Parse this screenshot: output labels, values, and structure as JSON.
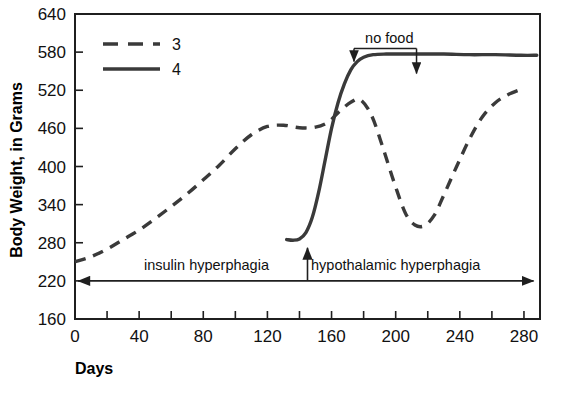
{
  "chart_data": {
    "type": "line",
    "title": "",
    "xlabel": "Days",
    "ylabel": "Body Weight, in Grams",
    "xlim": [
      0,
      290
    ],
    "ylim": [
      160,
      640
    ],
    "grid": false,
    "legend_position": "top-left",
    "x_ticks": [
      0,
      20,
      40,
      60,
      80,
      100,
      120,
      140,
      160,
      180,
      200,
      220,
      240,
      260,
      280
    ],
    "x_ticklabels": [
      "0",
      "",
      "40",
      "",
      "80",
      "",
      "120",
      "",
      "160",
      "",
      "200",
      "",
      "240",
      "",
      "280"
    ],
    "y_ticks": [
      160,
      220,
      280,
      340,
      400,
      460,
      520,
      580,
      640
    ],
    "y_ticklabels": [
      "160",
      "220",
      "280",
      "340",
      "400",
      "460",
      "520",
      "580",
      "640"
    ],
    "series": [
      {
        "name": "3",
        "style": "dashed",
        "color": "#3a3a3a",
        "x": [
          0,
          10,
          20,
          30,
          40,
          50,
          60,
          70,
          80,
          90,
          100,
          110,
          120,
          130,
          140,
          150,
          158,
          165,
          172,
          178,
          185,
          192,
          199,
          206,
          212,
          218,
          224,
          230,
          238,
          246,
          254,
          262,
          270,
          280
        ],
        "y": [
          250,
          258,
          270,
          285,
          300,
          318,
          337,
          357,
          379,
          402,
          428,
          450,
          463,
          465,
          461,
          462,
          470,
          487,
          501,
          505,
          480,
          430,
          375,
          327,
          308,
          307,
          323,
          355,
          400,
          443,
          478,
          500,
          513,
          523
        ]
      },
      {
        "name": "4",
        "style": "solid",
        "color": "#3a3a3a",
        "x": [
          132,
          136,
          140,
          144,
          148,
          152,
          156,
          160,
          164,
          168,
          172,
          176,
          180,
          186,
          194,
          204,
          216,
          230,
          246,
          262,
          278,
          288
        ],
        "y": [
          285,
          284,
          286,
          296,
          320,
          360,
          410,
          460,
          500,
          530,
          552,
          565,
          572,
          576,
          577,
          577,
          577,
          577,
          576,
          576,
          575,
          575
        ]
      }
    ],
    "annotations": [
      {
        "name": "no-food",
        "text": "no food",
        "x_from": 174,
        "x_to": 213,
        "y_text": 592
      },
      {
        "name": "insulin-hyperphagia",
        "text": "insulin hyperphagia",
        "x_center": 82,
        "y": 220
      },
      {
        "name": "hypothalamic-hyperphagia",
        "text": "hypothalamic hyperphagia",
        "x_center": 200,
        "y": 220
      },
      {
        "name": "phase-divider-arrow",
        "text": "",
        "x": 145,
        "y_from": 220,
        "y_to": 272
      },
      {
        "name": "phase-span-arrow",
        "text": "",
        "x_from": 2,
        "x_to": 286,
        "y": 220
      }
    ]
  },
  "legend": {
    "items": [
      {
        "label": "3",
        "style": "dashed"
      },
      {
        "label": "4",
        "style": "solid"
      }
    ]
  },
  "axes": {
    "y_title": "Body Weight, in Grams",
    "x_title": "Days"
  },
  "colors": {
    "line": "#3a3a3a",
    "axis": "#1f1f1f",
    "text": "#111111",
    "background": "#ffffff"
  }
}
